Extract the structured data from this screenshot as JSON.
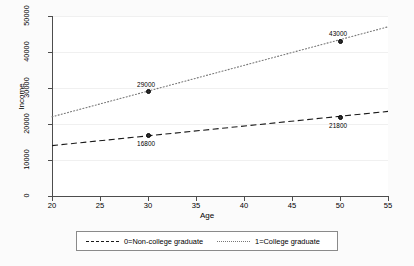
{
  "chart_data": {
    "type": "line",
    "title": "",
    "xlabel": "Age",
    "ylabel": "Income",
    "xlim": [
      20,
      55
    ],
    "ylim": [
      0,
      50000
    ],
    "xticks": [
      "20",
      "25",
      "30",
      "35",
      "40",
      "45",
      "50",
      "55"
    ],
    "yticks": [
      "0",
      "10000",
      "20000",
      "30000",
      "40000",
      "50000"
    ],
    "grid": true,
    "legend_position": "bottom",
    "series": [
      {
        "name": "0=Non-college graduate",
        "style": "dashed",
        "color": "#1a1a1a",
        "x": [
          20,
          55
        ],
        "y": [
          14000,
          23500
        ],
        "points": [
          {
            "x": 30,
            "y": 16800,
            "label": "16800",
            "label_pos": "below"
          },
          {
            "x": 50,
            "y": 21800,
            "label": "21800",
            "label_pos": "below"
          }
        ]
      },
      {
        "name": "1=College graduate",
        "style": "dotted",
        "color": "#777777",
        "x": [
          20,
          55
        ],
        "y": [
          22000,
          47000
        ],
        "points": [
          {
            "x": 30,
            "y": 29000,
            "label": "29000",
            "label_pos": "above"
          },
          {
            "x": 50,
            "y": 43000,
            "label": "43000",
            "label_pos": "above"
          }
        ]
      }
    ]
  },
  "legend": {
    "entries": [
      {
        "label": "0=Non-college graduate",
        "style": "dashed"
      },
      {
        "label": "1=College graduate",
        "style": "dotted"
      }
    ]
  },
  "axes": {
    "x_title": "Age",
    "y_title": "Income"
  }
}
